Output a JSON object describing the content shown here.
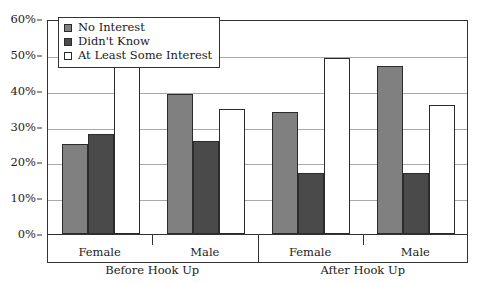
{
  "chart_data": {
    "type": "bar",
    "title": "",
    "xlabel": "",
    "ylabel": "",
    "ylim": [
      0,
      60
    ],
    "ytick_labels": [
      "0%",
      "10%",
      "20%",
      "30%",
      "40%",
      "50%",
      "60%"
    ],
    "ytick_values": [
      0,
      10,
      20,
      30,
      40,
      50,
      60
    ],
    "grid": true,
    "legend_position": "top-left",
    "categories": [
      "Female",
      "Male",
      "Female",
      "Male"
    ],
    "group_labels": [
      "Before Hook Up",
      "After Hook Up"
    ],
    "series": [
      {
        "name": "No Interest",
        "color": "#808080",
        "values": [
          25,
          39,
          34,
          47
        ]
      },
      {
        "name": "Didn't Know",
        "color": "#4a4a4a",
        "values": [
          28,
          26,
          17,
          17
        ]
      },
      {
        "name": "At Least Some Interest",
        "color": "#ffffff",
        "values": [
          47,
          35,
          49,
          36
        ]
      }
    ]
  },
  "legend": {
    "items": [
      {
        "label": "No Interest",
        "color": "#808080"
      },
      {
        "label": "Didn't Know",
        "color": "#4a4a4a"
      },
      {
        "label": "At Least Some Interest",
        "color": "#ffffff"
      }
    ]
  },
  "axis": {
    "y_labels": [
      "60%",
      "50%",
      "40%",
      "30%",
      "20%",
      "10%",
      "0%"
    ],
    "x_level1": [
      "Female",
      "Male",
      "Female",
      "Male"
    ],
    "x_level2": [
      "Before Hook Up",
      "After Hook Up"
    ]
  },
  "colors": {
    "series_no_interest": "#808080",
    "series_didnt_know": "#4a4a4a",
    "series_some_interest": "#ffffff",
    "grid": "#a8a8a8",
    "frame": "#333333"
  }
}
